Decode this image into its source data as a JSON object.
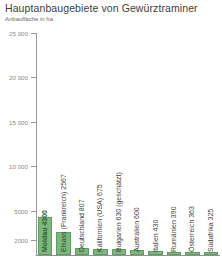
{
  "chart_data": {
    "type": "bar",
    "title": "Hauptanbaugebiete von Gewürztraminer",
    "subtitle": "Anbaufläche in ha",
    "xlabel": "",
    "ylabel": "",
    "grid": false,
    "legend": "none",
    "ylim": [
      0,
      25000
    ],
    "ytick_labels": [
      "25 000",
      "20 000",
      "15 000",
      "10 000",
      "5000",
      "2000"
    ],
    "ytick_values": [
      25000,
      20000,
      15000,
      10000,
      5000,
      2000
    ],
    "categories": [
      "Moldau",
      "Elsass (Frankreich)",
      "Deutschland",
      "Kalifornien (USA)",
      "Bulgarien",
      "Australien",
      "Italien",
      "Rumänien",
      "Österreich",
      "Südafrika"
    ],
    "values": [
      4300,
      2567,
      807,
      675,
      630,
      600,
      430,
      390,
      363,
      325
    ],
    "bar_labels": [
      "Moldau 4300",
      "Elsass (Frankreich) 2567",
      "Deutschland 807",
      "Kalifornien (USA) 675",
      "Bulgarien 630 (geschätzt)",
      "Australien 600",
      "Italien 430",
      "Rumänien 390",
      "Österreich 363",
      "Südafrika 325"
    ],
    "highlighted_index": 0,
    "bar_color": "#7cb87c",
    "bar_border_color": "#5d9e62",
    "highlight_label_color": "#2f5d33",
    "axis_color": "#9a9a9a",
    "tick_label_color": "#8a8a8a"
  }
}
